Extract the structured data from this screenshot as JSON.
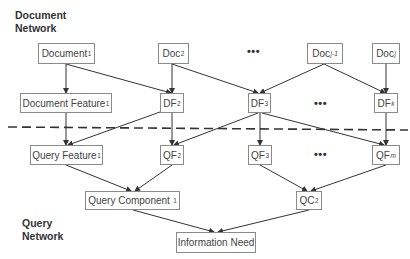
{
  "labels": {
    "document_network_line1": "Document",
    "document_network_line2": "Network",
    "query_network_line1": "Query",
    "query_network_line2": "Network"
  },
  "ellipsis": "•••",
  "nodes": {
    "document_1": {
      "base": "Document",
      "sub": "1"
    },
    "doc_2": {
      "base": "Doc",
      "sub": "2"
    },
    "doc_j_minus_1": {
      "base": "Doc",
      "sub": "j-1"
    },
    "doc_j": {
      "base": "Doc",
      "sub": "j"
    },
    "document_feature_1": {
      "base": "Document Feature",
      "sub": "1"
    },
    "df_2": {
      "base": "DF",
      "sub": "2"
    },
    "df_3": {
      "base": "DF",
      "sub": "3"
    },
    "df_k": {
      "base": "DF",
      "sub": "k"
    },
    "query_feature_1": {
      "base": "Query Feature",
      "sub": "1"
    },
    "qf_2": {
      "base": "QF",
      "sub": "2"
    },
    "qf_3": {
      "base": "QF",
      "sub": "3"
    },
    "qf_m": {
      "base": "QF",
      "sub": "m"
    },
    "query_component_1": {
      "base": "Query Component ",
      "sub": "1"
    },
    "qc_2": {
      "base": "QC",
      "sub": "2"
    },
    "information_need": {
      "base": "Information Need",
      "sub": ""
    }
  },
  "edges": [
    [
      "Document_1",
      "Document Feature_1"
    ],
    [
      "Document_1",
      "DF_2"
    ],
    [
      "Doc_2",
      "DF_2"
    ],
    [
      "Doc_2",
      "DF_3"
    ],
    [
      "Doc_j-1",
      "DF_3"
    ],
    [
      "Doc_j-1",
      "DF_k"
    ],
    [
      "Doc_j",
      "DF_k"
    ],
    [
      "Document Feature_1",
      "Query Feature_1"
    ],
    [
      "DF_2",
      "Query Feature_1"
    ],
    [
      "DF_2",
      "QF_2"
    ],
    [
      "DF_3",
      "QF_2"
    ],
    [
      "DF_3",
      "QF_3"
    ],
    [
      "DF_3",
      "QF_m"
    ],
    [
      "DF_k",
      "QF_m"
    ],
    [
      "Query Feature_1",
      "Query Component_1"
    ],
    [
      "QF_2",
      "Query Component_1"
    ],
    [
      "QF_3",
      "QC_2"
    ],
    [
      "QF_m",
      "QC_2"
    ],
    [
      "Query Component_1",
      "Information Need"
    ],
    [
      "QC_2",
      "Information Need"
    ]
  ],
  "colors": {
    "edge": "#333333",
    "box_border": "#8a8a8a",
    "divider": "#333333"
  }
}
